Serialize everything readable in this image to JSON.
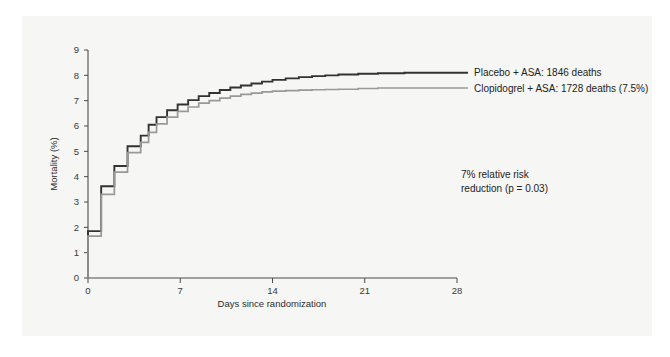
{
  "chart_data": {
    "type": "line",
    "title": "",
    "subtitle": "",
    "xlabel": "Days since randomization",
    "ylabel": "Mortality (%)",
    "xlim": [
      0,
      28
    ],
    "ylim": [
      0,
      9
    ],
    "xticks": [
      0,
      7,
      14,
      21,
      28
    ],
    "xtick_labels": [
      "0",
      "7",
      "14",
      "21",
      "28"
    ],
    "yticks": [
      0,
      1,
      2,
      3,
      4,
      5,
      6,
      7,
      8,
      9
    ],
    "ytick_labels": [
      "0",
      "1",
      "2",
      "3",
      "4",
      "5",
      "6",
      "7",
      "8",
      "9"
    ],
    "grid": false,
    "legend_position": "right-of-plot",
    "step_style": "post",
    "series": [
      {
        "name": "Placebo + ASA: 1846 deaths",
        "short_name": "Placebo + ASA",
        "color": "#333333",
        "deaths": 1846,
        "x": [
          0,
          0.35,
          1,
          2,
          3,
          4,
          4.6,
          5.2,
          6,
          6.8,
          7.6,
          8.4,
          9.2,
          10,
          10.8,
          11.6,
          12.4,
          13.2,
          14,
          15,
          16,
          17,
          18,
          19,
          20.5,
          22,
          24,
          26,
          28
        ],
        "values": [
          0,
          1.85,
          1.85,
          3.62,
          4.42,
          5.2,
          5.62,
          6.05,
          6.35,
          6.62,
          6.85,
          7.02,
          7.18,
          7.3,
          7.42,
          7.52,
          7.6,
          7.68,
          7.75,
          7.82,
          7.88,
          7.93,
          7.97,
          8.0,
          8.03,
          8.06,
          8.08,
          8.1,
          8.1
        ]
      },
      {
        "name": "Clopidogrel + ASA: 1728 deaths (7.5%)",
        "short_name": "Clopidogrel + ASA",
        "color": "#999999",
        "deaths": 1728,
        "final_percent": 7.5,
        "x": [
          0,
          0.35,
          1,
          2,
          3,
          4,
          4.6,
          5.2,
          6,
          6.8,
          7.6,
          8.4,
          9.2,
          10,
          10.8,
          11.6,
          12.4,
          13.2,
          14,
          15,
          16,
          17,
          18,
          19,
          20.5,
          22,
          24,
          26,
          28
        ],
        "values": [
          0,
          1.65,
          1.65,
          3.3,
          4.18,
          4.95,
          5.35,
          5.75,
          6.08,
          6.35,
          6.58,
          6.75,
          6.9,
          7.0,
          7.1,
          7.18,
          7.25,
          7.3,
          7.35,
          7.38,
          7.4,
          7.42,
          7.43,
          7.44,
          7.45,
          7.48,
          7.5,
          7.5,
          7.5
        ]
      }
    ],
    "annotations": [
      {
        "id": "relative-risk",
        "lines": [
          "7% relative risk",
          "reduction (p = 0.03)"
        ]
      }
    ]
  },
  "legend": {
    "entries": [
      {
        "label": "Placebo + ASA: 1846 deaths",
        "color": "#333333"
      },
      {
        "label": "Clopidogrel + ASA: 1728 deaths (7.5%)",
        "color": "#999999"
      }
    ]
  },
  "annotation": {
    "line1": "7% relative risk",
    "line2": "reduction (p = 0.03)"
  },
  "axes": {
    "x_title": "Days since randomization",
    "y_title": "Mortality (%)",
    "x_tick_labels": [
      "0",
      "7",
      "14",
      "21",
      "28"
    ],
    "y_tick_labels": [
      "0",
      "1",
      "2",
      "3",
      "4",
      "5",
      "6",
      "7",
      "8",
      "9"
    ]
  },
  "colors": {
    "placebo": "#333333",
    "clopidogrel": "#999999",
    "axis": "#4a4a4a",
    "text": "#232323",
    "page_tint": "#f6f6f4"
  }
}
